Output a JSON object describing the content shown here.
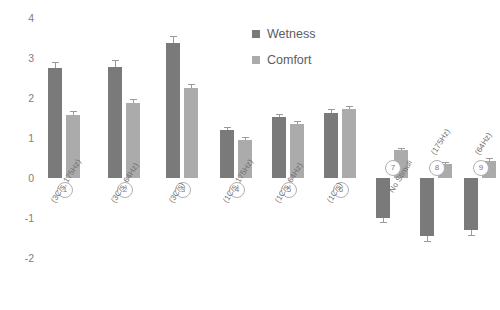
{
  "chart_data": {
    "type": "bar",
    "title": "",
    "xlabel": "",
    "ylabel": "",
    "ylim": [
      -2,
      4
    ],
    "yticks": [
      4,
      3,
      2,
      1,
      0,
      -1,
      -2
    ],
    "grid": false,
    "legend_position": "top-right",
    "categories": [
      "(3C/s, 175Hz)",
      "(3C/s, 64Hz)",
      "(3C/s)",
      "(1C/s, 175Hz)",
      "(1C/s, 64Hz)",
      "(1C/s)",
      "No Stimuli",
      "(175Hz)",
      "(64Hz)"
    ],
    "category_numbers": [
      "1",
      "2",
      "3",
      "4",
      "5",
      "6",
      "7",
      "8",
      "9"
    ],
    "series": [
      {
        "name": "Wetness",
        "color": "#7a7a7a",
        "values": [
          2.75,
          2.78,
          3.38,
          1.2,
          1.52,
          1.62,
          -1.0,
          -1.45,
          -1.3
        ],
        "errors": [
          0.15,
          0.16,
          0.17,
          0.08,
          0.08,
          0.1,
          0.1,
          0.12,
          0.12
        ]
      },
      {
        "name": "Comfort",
        "color": "#ababab",
        "values": [
          1.58,
          1.88,
          2.25,
          0.95,
          1.35,
          1.72,
          0.7,
          0.36,
          0.42
        ],
        "errors": [
          0.09,
          0.09,
          0.1,
          0.07,
          0.07,
          0.08,
          0.05,
          0.04,
          0.07
        ]
      }
    ]
  },
  "legend": {
    "items": [
      {
        "label": "Wetness",
        "color": "#7a7a7a"
      },
      {
        "label": "Comfort",
        "color": "#ababab"
      }
    ]
  },
  "axis": {
    "tick_color": "#808080",
    "label_color": "#6f6f6f"
  }
}
